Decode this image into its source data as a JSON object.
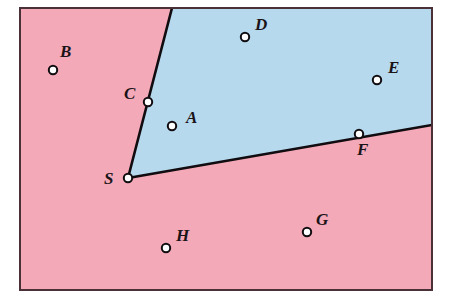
{
  "figure": {
    "frame": {
      "x": 20,
      "y": 8,
      "width": 412,
      "height": 282,
      "border_color": "#4a3138",
      "border_width": 2
    },
    "regions": [
      {
        "name": "exterior-region",
        "color": "#f4a9b8",
        "description": "pink exterior of the angle"
      },
      {
        "name": "interior-region",
        "color": "#b6d9ee",
        "description": "blue interior of the angle"
      }
    ],
    "rays": {
      "color": "#100c10",
      "width": 2.6,
      "vertex": {
        "x": 128,
        "y": 178
      },
      "ray_1_end": {
        "x": 172,
        "y": 8
      },
      "ray_2_end": {
        "x": 432,
        "y": 125
      }
    },
    "marker": {
      "radius": 4.2,
      "fill_on_line": "#ffffff",
      "fill_off_line": "#ffffff",
      "stroke": "#100c10",
      "stroke_width": 2
    },
    "points": [
      {
        "id": "A",
        "label": "A",
        "x": 172,
        "y": 126,
        "label_x": 186,
        "label_y": 123,
        "on_line": false,
        "region": "interior"
      },
      {
        "id": "B",
        "label": "B",
        "x": 53,
        "y": 70,
        "label_x": 60,
        "label_y": 57,
        "on_line": false,
        "region": "exterior"
      },
      {
        "id": "C",
        "label": "C",
        "x": 148,
        "y": 102,
        "label_x": 124,
        "label_y": 99,
        "on_line": true,
        "region": "boundary"
      },
      {
        "id": "D",
        "label": "D",
        "x": 245,
        "y": 37,
        "label_x": 255,
        "label_y": 30,
        "on_line": false,
        "region": "interior"
      },
      {
        "id": "E",
        "label": "E",
        "x": 377,
        "y": 80,
        "label_x": 388,
        "label_y": 73,
        "on_line": false,
        "region": "interior"
      },
      {
        "id": "F",
        "label": "F",
        "x": 359,
        "y": 134,
        "label_x": 357,
        "label_y": 155,
        "on_line": true,
        "region": "boundary"
      },
      {
        "id": "G",
        "label": "G",
        "x": 307,
        "y": 232,
        "label_x": 316,
        "label_y": 225,
        "on_line": false,
        "region": "exterior"
      },
      {
        "id": "H",
        "label": "H",
        "x": 166,
        "y": 248,
        "label_x": 176,
        "label_y": 241,
        "on_line": false,
        "region": "exterior"
      },
      {
        "id": "S",
        "label": "S",
        "x": 128,
        "y": 178,
        "label_x": 104,
        "label_y": 184,
        "on_line": true,
        "region": "vertex"
      }
    ]
  }
}
